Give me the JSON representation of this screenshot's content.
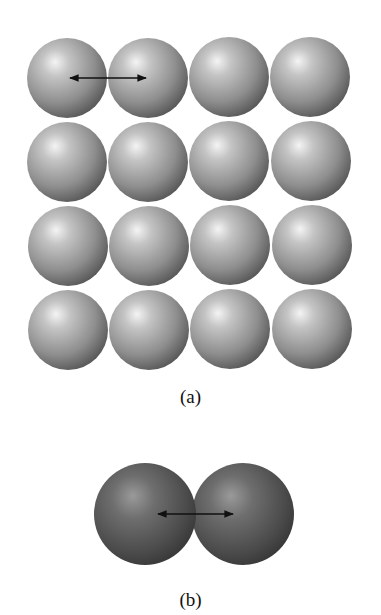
{
  "figure": {
    "panel_a": {
      "caption": "(a)",
      "description": "4x4 square lattice of identical light gray spheres",
      "rows": 4,
      "cols": 4,
      "sphere_color": "#9a9a9a",
      "arrow": "double-headed arrow between centers of first two spheres in top row"
    },
    "panel_b": {
      "caption": "(b)",
      "description": "two overlapping dark gray spheres (diatomic molecule)",
      "sphere_color": "#555555",
      "arrow": "double-headed arrow between the two sphere centers"
    }
  }
}
